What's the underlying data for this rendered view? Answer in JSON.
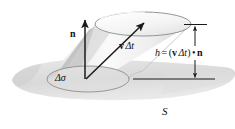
{
  "figure": {
    "background_color": "#ffffff",
    "ink_color": "#111111",
    "labels": {
      "normal_vector": "n",
      "displacement_vector_bold": "v",
      "displacement_vector_delta_t": "Δt",
      "area_element": "Δσ",
      "height_equation_lhs": "h",
      "height_equation_equals": "=",
      "height_equation_open": "(",
      "height_equation_close": ")",
      "height_equation_dot": "•",
      "surface": "S"
    },
    "colors": {
      "surface_fill": "#d7d7d7",
      "surface_fill_light": "#e3e3e3",
      "cylinder_body_light": "#f2f2f2",
      "cylinder_body_mid": "#e0e0e0",
      "cylinder_shadow_dark": "#b9b9b9",
      "top_ellipse_fill": "#f7f7f7",
      "ellipse_stroke": "#8a8a8a",
      "arrow_stroke": "#1a1a1a",
      "dimension_line": "#1a1a1a"
    },
    "geometry": {
      "top_ellipse": {
        "cx": 143,
        "cy": 24,
        "rx": 48,
        "ry": 12
      },
      "bottom_ellipse": {
        "cx": 88,
        "cy": 79,
        "rx": 41,
        "ry": 13
      },
      "normal_arrow": {
        "x1": 85,
        "y1": 79,
        "x2": 85,
        "y2": 19
      },
      "velocity_arrow": {
        "x1": 86,
        "y1": 79,
        "x2": 145,
        "y2": 22
      },
      "dimension_x": 195,
      "dimension_top_y": 25,
      "dimension_bottom_y": 79,
      "baseline_y": 79,
      "baseline_x1": 133,
      "baseline_x2": 215
    }
  }
}
